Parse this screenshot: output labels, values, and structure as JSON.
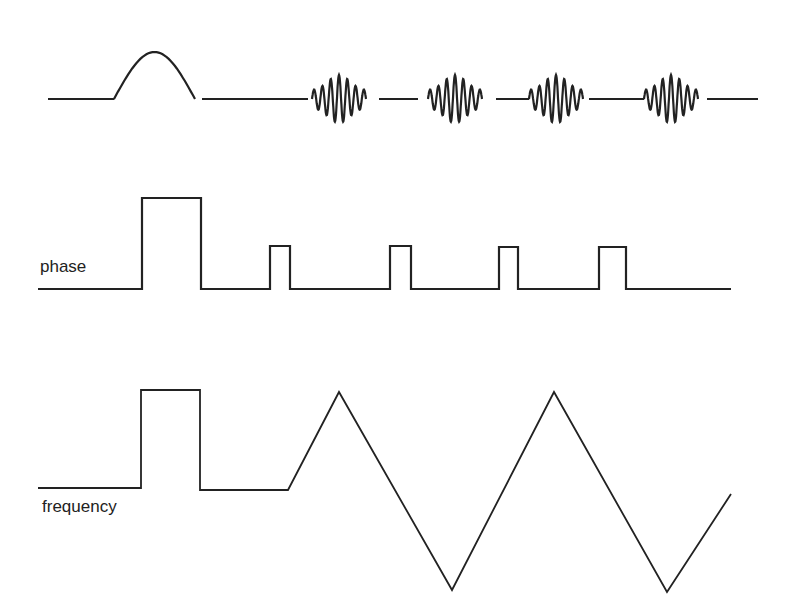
{
  "diagram": {
    "type": "pulse-sequence timing diagram",
    "stroke_color": "#222222",
    "background": "#ffffff",
    "rows": [
      {
        "id": "rf",
        "label": "",
        "description": "RF channel: half-sine excitation pulse followed by four oscillating wave packets separated by flat baseline",
        "baseline_y": 99,
        "elements": [
          {
            "kind": "line",
            "x": [
              48,
              114
            ]
          },
          {
            "kind": "half-sine",
            "x": [
              114,
              195
            ],
            "peak_y": 52
          },
          {
            "kind": "line",
            "x": [
              202,
              308
            ]
          },
          {
            "kind": "wave-packet",
            "x": [
              312,
              366
            ]
          },
          {
            "kind": "line",
            "x": [
              379,
              418
            ]
          },
          {
            "kind": "wave-packet",
            "x": [
              428,
              482
            ]
          },
          {
            "kind": "line",
            "x": [
              496,
              529
            ]
          },
          {
            "kind": "wave-packet",
            "x": [
              529,
              583
            ]
          },
          {
            "kind": "line",
            "x": [
              589,
              644
            ]
          },
          {
            "kind": "wave-packet",
            "x": [
              644,
              698
            ]
          },
          {
            "kind": "line",
            "x": [
              707,
              758
            ]
          }
        ]
      },
      {
        "id": "phase",
        "label": "phase",
        "baseline_y": 289,
        "pulses": [
          {
            "x": [
              142,
              201
            ],
            "top_y": 198
          },
          {
            "x": [
              270,
              290
            ],
            "top_y": 246
          },
          {
            "x": [
              390,
              411
            ],
            "top_y": 246
          },
          {
            "x": [
              499,
              518
            ],
            "top_y": 247
          },
          {
            "x": [
              599,
              626
            ],
            "top_y": 247
          }
        ],
        "x_range": [
          38,
          731
        ]
      },
      {
        "id": "frequency",
        "label": "frequency",
        "baseline_y": 488,
        "points": [
          [
            38,
            488
          ],
          [
            141,
            488
          ],
          [
            141,
            390
          ],
          [
            200,
            390
          ],
          [
            200,
            490
          ],
          [
            288,
            490
          ],
          [
            339,
            392
          ],
          [
            452,
            590
          ],
          [
            554,
            392
          ],
          [
            667,
            592
          ],
          [
            731,
            494
          ]
        ]
      }
    ]
  }
}
